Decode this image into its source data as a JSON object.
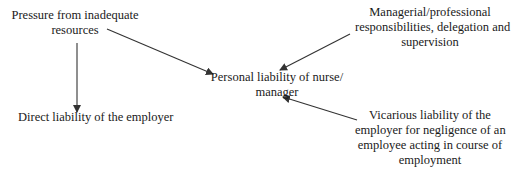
{
  "diagram": {
    "type": "influence-diagram",
    "nodes": {
      "pressure": {
        "lines": [
          "Pressure from inadequate",
          "resources"
        ]
      },
      "direct": {
        "lines": [
          "Direct liability of the employer"
        ]
      },
      "personal": {
        "lines": [
          "Personal liability of nurse/",
          "manager"
        ]
      },
      "managerial": {
        "lines": [
          "Managerial/professional",
          "responsibilities, delegation and",
          "supervision"
        ]
      },
      "vicarious": {
        "lines": [
          "Vicarious liability of the",
          "employer for negligence of an",
          "employee acting in course of",
          "employment"
        ]
      }
    },
    "edges": [
      {
        "from": "pressure",
        "to": "personal"
      },
      {
        "from": "pressure",
        "to": "direct"
      },
      {
        "from": "managerial",
        "to": "personal"
      },
      {
        "from": "vicarious",
        "to": "personal"
      }
    ],
    "colors": {
      "text": "#1a1a1a",
      "arrow": "#333333",
      "background": "#ffffff"
    }
  }
}
